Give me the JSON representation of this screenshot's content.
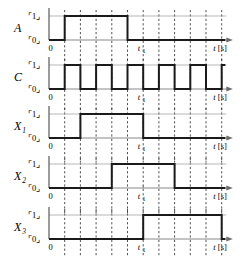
{
  "figure": {
    "type": "timing-diagram",
    "title": "",
    "background_color": "#ffffff",
    "waveform_color": "#1a1a1a",
    "gridline_color": "#3d3d3d",
    "axis_color": "#6b6b6b"
  },
  "axis": {
    "origin_label": "0",
    "time_label": "t",
    "time_unit": "[s]",
    "marker_label": "t",
    "marker_sub": "1",
    "marker_gridline_index": 6,
    "gridline_count": 11,
    "high_label_open": "⌜",
    "high_label_value": "1",
    "high_label_close": "⌟",
    "low_label_open": "⌜",
    "low_label_value": "0",
    "low_label_close": "⌟"
  },
  "chart_data": {
    "type": "line",
    "title": "",
    "xlabel": "t [s]",
    "ylabel": "",
    "x_ticks": [
      0,
      1,
      2,
      3,
      4,
      5,
      6,
      7,
      8,
      9,
      10,
      11
    ],
    "x_tick_labels": [
      "0",
      "",
      "",
      "",
      "",
      "",
      "t1",
      "",
      "",
      "",
      "",
      ""
    ],
    "y_levels": [
      "0",
      "1"
    ],
    "ylim": [
      0,
      1
    ],
    "grid": true,
    "legend_position": "left",
    "series": [
      {
        "name": "A",
        "subscript": "",
        "values": [
          0,
          1,
          1,
          1,
          1,
          0,
          0,
          0,
          0,
          0,
          0,
          0
        ],
        "transitions": [
          {
            "x": 1,
            "edge": "rise"
          },
          {
            "x": 5,
            "edge": "fall"
          }
        ]
      },
      {
        "name": "C",
        "subscript": "",
        "values": [
          0,
          1,
          0,
          1,
          0,
          1,
          0,
          1,
          0,
          1,
          0,
          1
        ],
        "transitions": [
          {
            "x": 1,
            "edge": "rise"
          },
          {
            "x": 2,
            "edge": "fall"
          },
          {
            "x": 3,
            "edge": "rise"
          },
          {
            "x": 4,
            "edge": "fall"
          },
          {
            "x": 5,
            "edge": "rise"
          },
          {
            "x": 6,
            "edge": "fall"
          },
          {
            "x": 7,
            "edge": "rise"
          },
          {
            "x": 8,
            "edge": "fall"
          },
          {
            "x": 9,
            "edge": "rise"
          },
          {
            "x": 10,
            "edge": "fall"
          }
        ]
      },
      {
        "name": "X",
        "subscript": "1",
        "values": [
          0,
          0,
          1,
          1,
          1,
          1,
          0,
          0,
          0,
          0,
          0,
          0
        ],
        "transitions": [
          {
            "x": 2,
            "edge": "rise"
          },
          {
            "x": 6,
            "edge": "fall"
          }
        ]
      },
      {
        "name": "X",
        "subscript": "2",
        "values": [
          0,
          0,
          0,
          0,
          1,
          1,
          1,
          1,
          0,
          0,
          0,
          0
        ],
        "transitions": [
          {
            "x": 4,
            "edge": "rise"
          },
          {
            "x": 8,
            "edge": "fall"
          }
        ]
      },
      {
        "name": "X",
        "subscript": "3",
        "values": [
          0,
          0,
          0,
          0,
          0,
          0,
          1,
          1,
          1,
          1,
          1,
          0
        ],
        "transitions": [
          {
            "x": 6,
            "edge": "rise"
          },
          {
            "x": 11,
            "edge": "fall"
          }
        ]
      }
    ]
  }
}
